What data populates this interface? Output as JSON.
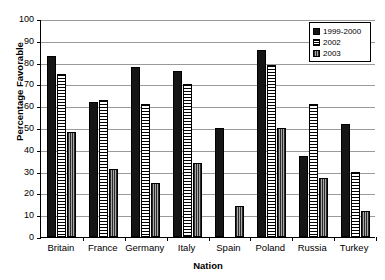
{
  "chart_data": {
    "type": "bar",
    "title": "",
    "xlabel": "Nation",
    "ylabel": "Percentage Favorable",
    "ylim": [
      0,
      100
    ],
    "ytick_step": 10,
    "yticks": [
      0,
      10,
      20,
      30,
      40,
      50,
      60,
      70,
      80,
      90,
      100
    ],
    "grid": true,
    "legend_position": "top-right-inside",
    "categories": [
      "Britain",
      "France",
      "Germany",
      "Italy",
      "Spain",
      "Poland",
      "Russia",
      "Turkey"
    ],
    "series": [
      {
        "name": "1999-2000",
        "style": "solid-black",
        "color": "#151515",
        "values": [
          83,
          62,
          78,
          76,
          50,
          86,
          37,
          52
        ]
      },
      {
        "name": "2002",
        "style": "horizontal-stripes",
        "color": "#ffffff",
        "values": [
          75,
          63,
          61,
          70,
          null,
          79,
          61,
          30
        ]
      },
      {
        "name": "2003",
        "style": "vertical-stripes-gray",
        "color": "#8d8d8d",
        "values": [
          48,
          31,
          25,
          34,
          14,
          50,
          27,
          12
        ]
      }
    ]
  },
  "legend": {
    "items": [
      {
        "label": "1999-2000"
      },
      {
        "label": "2002"
      },
      {
        "label": "2003"
      }
    ]
  }
}
